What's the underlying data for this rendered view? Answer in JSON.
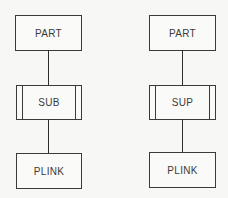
{
  "diagram": {
    "type": "hierarchy",
    "columns": [
      {
        "top": {
          "label": "PART",
          "style": "single"
        },
        "middle": {
          "label": "SUB",
          "style": "double-sided"
        },
        "bottom": {
          "label": "PLINK",
          "style": "single"
        }
      },
      {
        "top": {
          "label": "PART",
          "style": "single"
        },
        "middle": {
          "label": "SUP",
          "style": "double-sided"
        },
        "bottom": {
          "label": "PLINK",
          "style": "single"
        }
      }
    ],
    "colors": {
      "line": "#3a3a3a",
      "background": "#f7f7f5"
    }
  }
}
